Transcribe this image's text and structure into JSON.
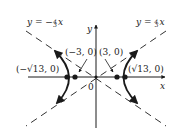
{
  "diagram": {
    "type": "hyperbola",
    "colors": {
      "ink": "#1a1a1a",
      "background": "#ffffff"
    },
    "axes": {
      "x_label": "x",
      "y_label": "y",
      "origin_label": "0"
    },
    "asymptotes": [
      {
        "label": "y = −⅘x",
        "display": "y = −",
        "frac": "4/3",
        "var": "x"
      },
      {
        "label": "y = ⅘x",
        "display": "y = ",
        "frac": "4/3",
        "var": "x"
      }
    ],
    "points": [
      {
        "label": "(−√13, 0)",
        "role": "focus-left"
      },
      {
        "label": "(−3, 0)",
        "role": "vertex-left"
      },
      {
        "label": "(3, 0)",
        "role": "vertex-right"
      },
      {
        "label": "(√13, 0)",
        "role": "focus-right"
      }
    ]
  }
}
